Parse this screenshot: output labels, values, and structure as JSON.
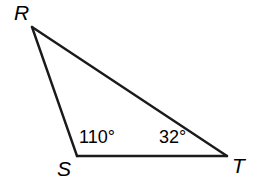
{
  "figure": {
    "type": "triangle-diagram",
    "background_color": "#ffffff",
    "stroke_color": "#1a1a1a",
    "stroke_width": 2.4
  },
  "vertices": [
    {
      "name": "R",
      "label": "R",
      "x": 32,
      "y": 27
    },
    {
      "name": "S",
      "label": "S",
      "x": 77,
      "y": 156
    },
    {
      "name": "T",
      "label": "T",
      "x": 227,
      "y": 156
    }
  ],
  "sides": [
    {
      "name": "RS",
      "from": "R",
      "to": "S"
    },
    {
      "name": "ST",
      "from": "S",
      "to": "T"
    },
    {
      "name": "RT",
      "from": "R",
      "to": "T"
    }
  ],
  "angles": [
    {
      "at_vertex": "S",
      "label": "110°",
      "value": 110
    },
    {
      "at_vertex": "T",
      "label": "32°",
      "value": 32
    }
  ]
}
